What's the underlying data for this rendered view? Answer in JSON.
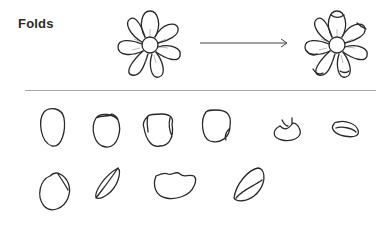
{
  "title": "Folds",
  "colors": {
    "ink": "#2a2a2a",
    "divider": "#a8a8a8",
    "background": "#ffffff"
  },
  "illustration": {
    "before": "flat-flower",
    "arrow": "right-arrow",
    "after": "folded-flower",
    "petal_rows": [
      [
        "petal-round",
        "petal-fold-top",
        "petal-fold-sides",
        "petal-fold-corner",
        "petal-cupped",
        "petal-rolled"
      ],
      [
        "petal-fold-corner-right",
        "petal-folded-half",
        "petal-wavy-top",
        "petal-curled"
      ]
    ]
  }
}
